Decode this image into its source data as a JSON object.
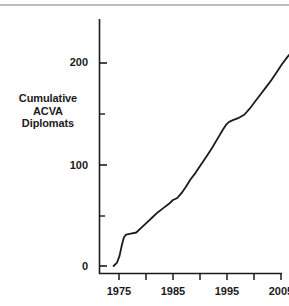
{
  "figure": {
    "top_rule_color": "#b9bcc0",
    "background": "#ffffff",
    "line_color": "#1b1b1b",
    "axis_color": "#1b1b1b"
  },
  "chart_data": {
    "type": "line",
    "title": "",
    "xlabel": "",
    "ylabel": "Cumulative\nACVA\nDiplomats",
    "ylabel_lines": [
      "Cumulative",
      "ACVA",
      "Diplomats"
    ],
    "xlim": [
      1972,
      2010
    ],
    "ylim": [
      0,
      245
    ],
    "grid": false,
    "legend": "none",
    "x_major_ticks": [
      1975,
      1985,
      1995,
      2005
    ],
    "x_minor_ticks": [
      1975,
      1980,
      1985,
      1990,
      1995,
      2000,
      2005,
      2010
    ],
    "x_tick_labels": [
      "1975",
      "1985",
      "1995",
      "2005"
    ],
    "y_major_ticks": [
      0,
      100,
      200
    ],
    "y_minor_ticks": [
      50,
      150
    ],
    "y_tick_labels": [
      "0",
      "100",
      "200"
    ],
    "series": [
      {
        "name": "Cumulative ACVA Diplomats",
        "x": [
          1974.0,
          1974.6,
          1975.1,
          1975.5,
          1975.9,
          1976.3,
          1977.2,
          1978.2,
          1979.2,
          1980.2,
          1981.2,
          1982.2,
          1983.2,
          1984.2,
          1985.0,
          1985.8,
          1986.6,
          1987.4,
          1988.2,
          1989.2,
          1990.2,
          1991.2,
          1992.2,
          1993.2,
          1994.2,
          1994.8,
          1995.4,
          1996.2,
          1997.2,
          1998.2,
          1999.2,
          2000.2,
          2001.2,
          2002.2,
          2003.2,
          2004.2,
          2005.2,
          2006.2,
          2007.2,
          2008.2,
          2009.0
        ],
        "y": [
          0,
          3,
          10,
          20,
          28,
          31,
          32,
          33,
          38,
          43,
          48,
          53,
          57,
          61,
          65,
          67,
          72,
          78,
          85,
          92,
          100,
          108,
          116,
          125,
          134,
          139,
          142,
          144,
          146,
          149,
          155,
          162,
          169,
          176,
          183,
          191,
          199,
          206,
          212,
          218,
          222
        ]
      }
    ]
  }
}
